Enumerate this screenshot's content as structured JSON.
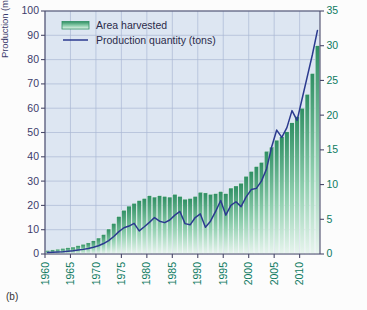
{
  "panel_label": "(b)",
  "axis_titles": {
    "left": "Production (million metric tons)",
    "right": "Area harvested (million ha)"
  },
  "legend": [
    {
      "label": "Area harvested",
      "marker": "area-swatch",
      "color": "#2f9e6e"
    },
    {
      "label": "Production quantity (tons)",
      "marker": "line-swatch",
      "color": "#2b3a8f"
    }
  ],
  "colors": {
    "plot_background": "#dde6f2",
    "grid": "#aab8d4",
    "bar_top": "#2f8f63",
    "bar_bottom": "#e8f5ee",
    "line": "#2b3a8f",
    "left_axis_text": "#3b3b6b",
    "right_axis_text": "#0d7a5f",
    "axis_line": "#4a4a6a"
  },
  "chart_data": {
    "type": "bar",
    "title": "",
    "xlabel": "",
    "ylabel": "Production (million metric tons)",
    "y2label": "Area harvested (million ha)",
    "ylim": [
      0,
      100
    ],
    "y2lim": [
      0,
      35
    ],
    "ytick_labels": [
      "0",
      "10",
      "20",
      "30",
      "40",
      "50",
      "60",
      "70",
      "80",
      "90",
      "100"
    ],
    "y2tick_labels": [
      "0",
      "5",
      "10",
      "15",
      "20",
      "25",
      "30",
      "35"
    ],
    "xlim": [
      1960,
      2013
    ],
    "xtick_labels": [
      "1960",
      "1965",
      "1970",
      "1975",
      "1980",
      "1985",
      "1990",
      "1995",
      "2000",
      "2005",
      "2010"
    ],
    "xticks": [
      1960,
      1965,
      1970,
      1975,
      1980,
      1985,
      1990,
      1995,
      2000,
      2005,
      2010
    ],
    "grid": true,
    "legend_position": "top-left",
    "x": [
      1960,
      1961,
      1962,
      1963,
      1964,
      1965,
      1966,
      1967,
      1968,
      1969,
      1970,
      1971,
      1972,
      1973,
      1974,
      1975,
      1976,
      1977,
      1978,
      1979,
      1980,
      1981,
      1982,
      1983,
      1984,
      1985,
      1986,
      1987,
      1988,
      1989,
      1990,
      1991,
      1992,
      1993,
      1994,
      1995,
      1996,
      1997,
      1998,
      1999,
      2000,
      2001,
      2002,
      2003,
      2004,
      2005,
      2006,
      2007,
      2008,
      2009,
      2010,
      2011,
      2012,
      2013
    ],
    "series": [
      {
        "name": "Area harvested",
        "axis": "right",
        "unit": "million ha",
        "type": "bar",
        "values": [
          0.5,
          0.6,
          0.7,
          0.8,
          0.9,
          1.0,
          1.2,
          1.4,
          1.6,
          1.9,
          2.3,
          2.8,
          3.6,
          4.4,
          5.4,
          6.3,
          6.9,
          7.3,
          7.7,
          8.0,
          8.4,
          8.2,
          8.4,
          8.3,
          8.2,
          8.6,
          8.3,
          7.9,
          8.0,
          8.3,
          8.9,
          8.8,
          8.6,
          8.7,
          9.0,
          8.7,
          9.5,
          9.8,
          10.2,
          11.2,
          11.9,
          12.6,
          13.2,
          14.8,
          15.4,
          16.4,
          16.9,
          17.6,
          18.9,
          19.8,
          21.0,
          23.0,
          26.0,
          30.0
        ]
      },
      {
        "name": "Production quantity (tons)",
        "axis": "left",
        "unit": "million metric tons",
        "type": "line",
        "values": [
          0.6,
          0.7,
          0.8,
          0.9,
          1.1,
          1.3,
          1.6,
          1.9,
          2.3,
          2.8,
          3.4,
          4.3,
          5.5,
          7.2,
          9.2,
          10.8,
          11.5,
          12.6,
          9.5,
          11.2,
          13.0,
          15.0,
          13.5,
          12.9,
          14.0,
          16.0,
          17.5,
          12.5,
          12.0,
          15.0,
          16.5,
          11.0,
          13.5,
          17.5,
          22.0,
          16.0,
          20.0,
          21.5,
          19.5,
          23.5,
          26.5,
          27.0,
          30.0,
          35.0,
          44.0,
          51.0,
          48.0,
          52.0,
          59.0,
          55.0,
          64.0,
          73.0,
          82.0,
          92.0
        ]
      }
    ]
  }
}
